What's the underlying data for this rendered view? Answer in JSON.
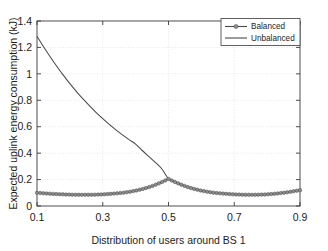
{
  "chart_data": {
    "type": "line",
    "title": "",
    "xlabel": "Distribution of users around BS 1",
    "ylabel": "Expected uplink energy consumption (kJ)",
    "xlim": [
      0.1,
      0.9
    ],
    "ylim": [
      0,
      1.4
    ],
    "xticks": [
      "0.1",
      "0.3",
      "0.5",
      "0.7",
      "0.9"
    ],
    "xtick_values": [
      0.1,
      0.3,
      0.5,
      0.7,
      0.9
    ],
    "yticks": [
      "0",
      "0.2",
      "0.4",
      "0.6",
      "0.8",
      "1",
      "1.2",
      "1.4"
    ],
    "ytick_values": [
      0,
      0.2,
      0.4,
      0.6,
      0.8,
      1.0,
      1.2,
      1.4
    ],
    "grid": true,
    "legend_position": "top-right",
    "x": [
      0.1,
      0.12,
      0.14,
      0.16,
      0.18,
      0.2,
      0.22,
      0.24,
      0.26,
      0.28,
      0.3,
      0.32,
      0.34,
      0.36,
      0.38,
      0.4,
      0.42,
      0.44,
      0.46,
      0.48,
      0.5,
      0.52,
      0.54,
      0.56,
      0.58,
      0.6,
      0.62,
      0.64,
      0.66,
      0.68,
      0.7,
      0.72,
      0.74,
      0.76,
      0.78,
      0.8,
      0.82,
      0.84,
      0.86,
      0.88,
      0.9
    ],
    "series": [
      {
        "name": "Balanced",
        "marker": "circle",
        "values": [
          0.1,
          0.096,
          0.093,
          0.09,
          0.088,
          0.086,
          0.085,
          0.085,
          0.085,
          0.086,
          0.088,
          0.091,
          0.095,
          0.1,
          0.107,
          0.116,
          0.128,
          0.142,
          0.16,
          0.181,
          0.205,
          0.181,
          0.16,
          0.142,
          0.128,
          0.116,
          0.107,
          0.1,
          0.095,
          0.091,
          0.088,
          0.086,
          0.085,
          0.085,
          0.086,
          0.088,
          0.092,
          0.097,
          0.103,
          0.111,
          0.12
        ]
      },
      {
        "name": "Unbalanced",
        "marker": "none",
        "values": [
          1.285,
          1.205,
          1.13,
          1.058,
          0.99,
          0.926,
          0.866,
          0.81,
          0.757,
          0.707,
          0.661,
          0.617,
          0.576,
          0.538,
          0.502,
          0.468,
          0.42,
          0.375,
          0.33,
          0.28,
          0.205,
          0.181,
          0.16,
          0.142,
          0.128,
          0.116,
          0.107,
          0.1,
          0.095,
          0.091,
          0.088,
          0.086,
          0.085,
          0.085,
          0.086,
          0.088,
          0.092,
          0.097,
          0.103,
          0.111,
          0.12
        ]
      }
    ],
    "colors": {
      "balanced": "#8d8d8d",
      "unbalanced": "#4a4a4a",
      "axis": "#3a3a3a",
      "grid": "#d8d8d8",
      "background": "#ffffff"
    }
  },
  "legend": {
    "items": [
      {
        "label": "Balanced"
      },
      {
        "label": "Unbalanced"
      }
    ]
  }
}
